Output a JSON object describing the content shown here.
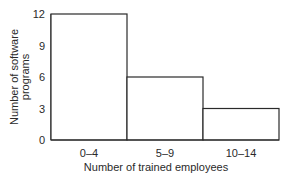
{
  "chart_data": {
    "type": "bar",
    "title": "",
    "xlabel": "Number of trained employees",
    "ylabel": "Number of software programs",
    "ylabel_lines": [
      "Number of software",
      "programs"
    ],
    "categories": [
      "0–4",
      "5–9",
      "10–14"
    ],
    "values": [
      12,
      6,
      3
    ],
    "ylim": [
      0,
      12
    ],
    "yticks": [
      0,
      3,
      6,
      9,
      12
    ],
    "grid": false,
    "legend": null,
    "bar_fill": "#ffffff",
    "bar_stroke": "#2a2a2a"
  }
}
